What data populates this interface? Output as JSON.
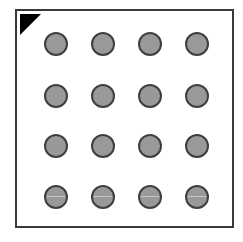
{
  "figure": {
    "type": "schematic-grid-layout",
    "background_color": "#ffffff",
    "plate": {
      "name": "plate-outline",
      "fill_color": "#ffffff",
      "border_color": "#3a3a3a",
      "border_width_px": 2,
      "x": 15,
      "y": 9,
      "width": 219,
      "height": 219
    },
    "fiducial": {
      "name": "orientation-marker",
      "shape": "right-triangle",
      "color": "#000000",
      "corner": "top-left",
      "size_px": 21
    },
    "wells": {
      "rows": 4,
      "columns": 4,
      "count": 16,
      "diameter_px": 24,
      "fill_color": "#999999",
      "outline_color": "#3f3f3f",
      "outline_width_px": 2,
      "column_centers_px": [
        39,
        86,
        133,
        180
      ],
      "row_centers_px": [
        33,
        85,
        135,
        186
      ],
      "banded_rows": [
        3
      ],
      "items": [
        {
          "row": 0,
          "col": 0,
          "cx": 39,
          "cy": 33,
          "banded": false
        },
        {
          "row": 0,
          "col": 1,
          "cx": 86,
          "cy": 33,
          "banded": false
        },
        {
          "row": 0,
          "col": 2,
          "cx": 133,
          "cy": 33,
          "banded": false
        },
        {
          "row": 0,
          "col": 3,
          "cx": 180,
          "cy": 33,
          "banded": false
        },
        {
          "row": 1,
          "col": 0,
          "cx": 39,
          "cy": 85,
          "banded": false
        },
        {
          "row": 1,
          "col": 1,
          "cx": 86,
          "cy": 85,
          "banded": false
        },
        {
          "row": 1,
          "col": 2,
          "cx": 133,
          "cy": 85,
          "banded": false
        },
        {
          "row": 1,
          "col": 3,
          "cx": 180,
          "cy": 85,
          "banded": false
        },
        {
          "row": 2,
          "col": 0,
          "cx": 39,
          "cy": 135,
          "banded": false
        },
        {
          "row": 2,
          "col": 1,
          "cx": 86,
          "cy": 135,
          "banded": false
        },
        {
          "row": 2,
          "col": 2,
          "cx": 133,
          "cy": 135,
          "banded": false
        },
        {
          "row": 2,
          "col": 3,
          "cx": 180,
          "cy": 135,
          "banded": false
        },
        {
          "row": 3,
          "col": 0,
          "cx": 39,
          "cy": 186,
          "banded": true
        },
        {
          "row": 3,
          "col": 1,
          "cx": 86,
          "cy": 186,
          "banded": true
        },
        {
          "row": 3,
          "col": 2,
          "cx": 133,
          "cy": 186,
          "banded": true
        },
        {
          "row": 3,
          "col": 3,
          "cx": 180,
          "cy": 186,
          "banded": true
        }
      ]
    }
  }
}
